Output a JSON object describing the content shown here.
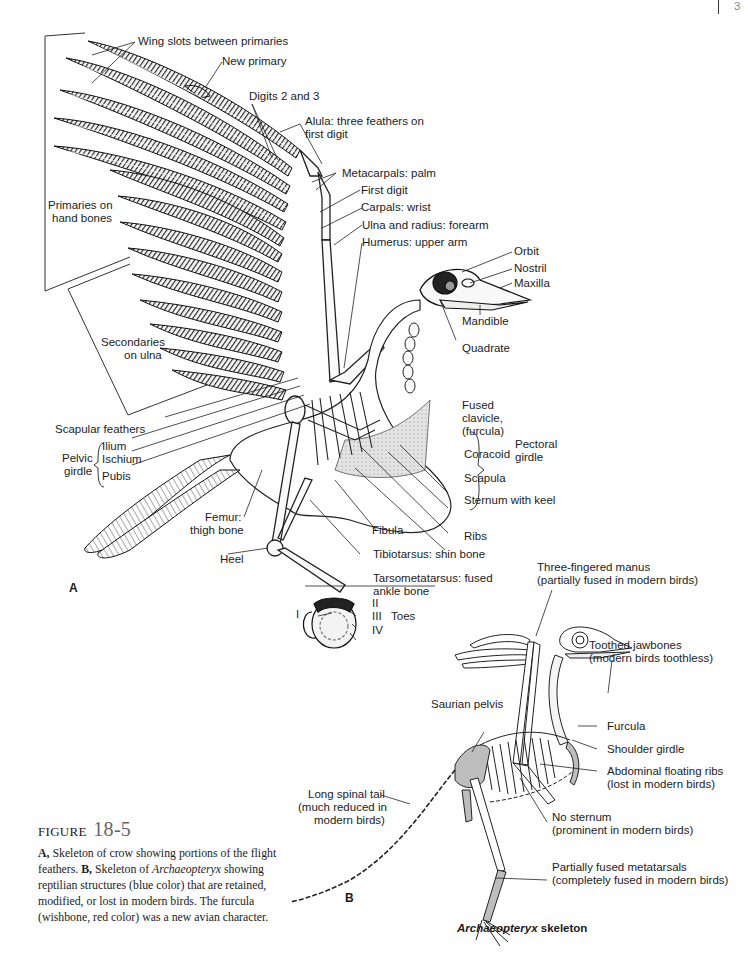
{
  "page_header": {
    "rule": "|",
    "page_number": "3"
  },
  "panel_a": {
    "letter": "A",
    "labels": {
      "wing_slots": "Wing slots between primaries",
      "new_primary": "New primary",
      "digits_2_3": "Digits 2 and 3",
      "alula_1": "Alula: three feathers on",
      "alula_2": "first digit",
      "metacarpals": "Metacarpals: palm",
      "first_digit": "First digit",
      "carpals": "Carpals: wrist",
      "ulna_radius": "Ulna and radius: forearm",
      "humerus": "Humerus: upper arm",
      "orbit": "Orbit",
      "nostril": "Nostril",
      "maxilla": "Maxilla",
      "mandible": "Mandible",
      "quadrate": "Quadrate",
      "primaries_1": "Primaries on",
      "primaries_2": "hand bones",
      "secondaries_1": "Secondaries",
      "secondaries_2": "on ulna",
      "scapular_feathers": "Scapular feathers",
      "pelvic_1": "Pelvic",
      "pelvic_2": "girdle",
      "ilium": "Ilium",
      "ischium": "Ischium",
      "pubis": "Pubis",
      "fused_clavicle_1": "Fused",
      "fused_clavicle_2": "clavicle,",
      "fused_clavicle_3": "(furcula)",
      "coracoid": "Coracoid",
      "scapula": "Scapula",
      "pectoral_1": "Pectoral",
      "pectoral_2": "girdle",
      "sternum": "Sternum with keel",
      "ribs": "Ribs",
      "fibula": "Fibula",
      "femur_1": "Femur:",
      "femur_2": "thigh bone",
      "tibiotarsus": "Tibiotarsus: shin bone",
      "heel": "Heel",
      "tarsometatarsus_1": "Tarsometatarsus: fused",
      "tarsometatarsus_2": "ankle bone",
      "toe_i": "I",
      "toe_ii": "II",
      "toe_iii": "III",
      "toe_iv": "IV",
      "toes": "Toes"
    }
  },
  "panel_b": {
    "letter": "B",
    "labels": {
      "manus_1": "Three-fingered manus",
      "manus_2": "(partially fused in modern birds)",
      "jaw_1": "Toothed jawbones",
      "jaw_2": "(modern birds toothless)",
      "saurian_pelvis": "Saurian pelvis",
      "furcula": "Furcula",
      "shoulder_girdle": "Shoulder girdle",
      "abdominal_1": "Abdominal floating ribs",
      "abdominal_2": "(lost in modern birds)",
      "tail_1": "Long spinal tail",
      "tail_2": "(much reduced in",
      "tail_3": "modern birds)",
      "no_sternum_1": "No sternum",
      "no_sternum_2": "(prominent in modern birds)",
      "metatarsals_1": "Partially fused metatarsals",
      "metatarsals_2": "(completely fused in modern birds)"
    },
    "caption_italic": "Archaeopteryx",
    "caption_rest": " skeleton",
    "highlight_color": "#bdbdbd"
  },
  "figure_caption": {
    "prefix": "FIGURE",
    "number": "18-5",
    "a_label": "A,",
    "a_text": " Skeleton of crow showing portions of the flight feathers. ",
    "b_label": "B,",
    "b_text_1": " Skeleton of ",
    "b_italic": "Archaeopteryx",
    "b_text_2": " showing reptilian structures (blue color) that are retained, modified, or lost in modern birds. The furcula (wishbone, red color) was a new avian character."
  }
}
